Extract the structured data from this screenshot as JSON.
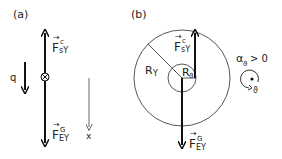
{
  "panels": {
    "a": {
      "label": "(a)",
      "force_up": {
        "symbol": "F",
        "sup": "c",
        "sub": "sY"
      },
      "force_down": {
        "symbol": "F",
        "sup": "G",
        "sub": "EY"
      },
      "coordinate_q": "q",
      "coordinate_x": "x"
    },
    "b": {
      "label": "(b)",
      "force_up": {
        "symbol": "F",
        "sup": "c",
        "sub": "sY"
      },
      "force_down": {
        "symbol": "F",
        "sup": "G",
        "sub": "EY"
      },
      "outer_radius": "R",
      "outer_radius_sub": "Y",
      "inner_radius": "R",
      "inner_radius_sub": "ϑ",
      "alpha": "α",
      "alpha_sub": "ϑ",
      "alpha_relation": "> 0",
      "rotation_label": "ϑ"
    }
  },
  "colors": {
    "stroke": "#111111",
    "light_stroke": "#555555"
  }
}
